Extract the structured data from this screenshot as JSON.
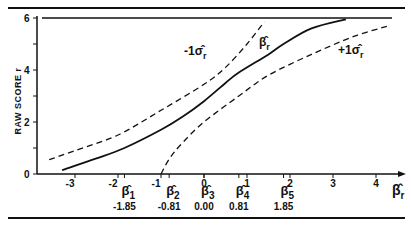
{
  "chart_data": {
    "type": "line",
    "title": "",
    "xlabel": "β̂r",
    "ylabel": "RAW SCORE r",
    "xlim": [
      -3.6,
      4.6
    ],
    "ylim": [
      0,
      6
    ],
    "x_ticks": [
      -3,
      -2,
      -1,
      0,
      1,
      2,
      3,
      4
    ],
    "y_ticks": [
      0,
      2,
      4,
      6
    ],
    "y_tick_labels": [
      "0",
      "2",
      "4",
      "6"
    ],
    "grid": false,
    "legend": "none (inline curve labels)",
    "series": [
      {
        "name": "β̂r",
        "style": "solid",
        "x": [
          -3.3,
          -2.5,
          -1.85,
          -1.0,
          -0.5,
          0.0,
          0.5,
          0.81,
          1.5,
          1.85,
          2.5,
          3.3
        ],
        "y": [
          0.15,
          0.6,
          1.0,
          1.7,
          2.2,
          2.8,
          3.5,
          3.9,
          4.6,
          5.0,
          5.6,
          5.95
        ]
      },
      {
        "name": "-1σ̂r",
        "style": "dashed",
        "x": [
          -3.6,
          -3.0,
          -2.0,
          -1.0,
          0.0,
          0.5,
          1.0,
          1.4
        ],
        "y": [
          0.55,
          0.9,
          1.5,
          2.45,
          3.45,
          4.1,
          5.0,
          5.85
        ]
      },
      {
        "name": "+1σ̂r",
        "style": "dashed",
        "x": [
          -1.0,
          -0.8,
          -0.5,
          0.0,
          0.81,
          1.5,
          2.5,
          3.5,
          4.3
        ],
        "y": [
          0.0,
          0.6,
          1.2,
          2.0,
          3.0,
          3.8,
          4.6,
          5.3,
          5.7
        ]
      }
    ],
    "upper_bound_line": {
      "y": 6,
      "label": "6"
    },
    "annotations": [
      {
        "text": "-1σ̂r",
        "near": "upper dashed curve"
      },
      {
        "text": "β̂r",
        "near": "solid curve"
      },
      {
        "text": "+1σ̂r",
        "near": "lower dashed curve"
      }
    ],
    "beta_markers": [
      {
        "label": "β̂1",
        "value": "-1.85",
        "x": -1.85
      },
      {
        "label": "β̂2",
        "value": "-0.81",
        "x": -0.81
      },
      {
        "label": "β̂3",
        "value": "0.00",
        "x": 0.0
      },
      {
        "label": "β̂4",
        "value": "0.81",
        "x": 0.81
      },
      {
        "label": "β̂5",
        "value": "1.85",
        "x": 1.85
      }
    ]
  },
  "labels": {
    "ylabel": "RAW SCORE r",
    "xaxis_symbol": "β̂",
    "xaxis_sub": "r",
    "minus_sigma": "-1σ̂",
    "plus_sigma": "+1σ̂",
    "sigma_sub": "r",
    "beta_curve": "β̂",
    "beta_curve_sub": "r"
  }
}
